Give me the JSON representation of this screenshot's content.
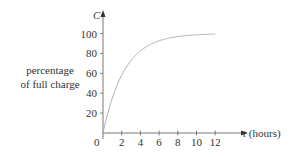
{
  "chart_data": {
    "type": "line",
    "title": "",
    "xlabel": "t (hours)",
    "ylabel": "percentage of full charge",
    "y_axis_symbol": "C",
    "x_axis_symbol": "t",
    "x_ticks": [
      0,
      2,
      4,
      6,
      8,
      10,
      12
    ],
    "y_ticks": [
      20,
      40,
      60,
      80,
      100
    ],
    "xlim": [
      0,
      13
    ],
    "ylim": [
      0,
      120
    ],
    "grid": false,
    "series": [
      {
        "name": "C(t)",
        "x": [
          0,
          1,
          2,
          3,
          4,
          5,
          6,
          7,
          8,
          9,
          10,
          11,
          12
        ],
        "values": [
          0,
          35,
          58,
          73,
          82,
          89,
          93,
          95,
          97,
          98,
          99,
          99,
          100
        ]
      }
    ],
    "line_color": "#b0b0b0",
    "axis_color": "#555555"
  },
  "labels": {
    "y_label_line1": "percentage",
    "y_label_line2": "of full charge",
    "y_symbol": "C",
    "x_label": "t (hours)",
    "origin": "0"
  }
}
